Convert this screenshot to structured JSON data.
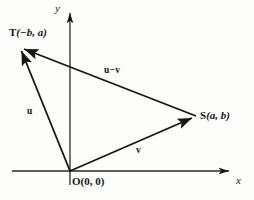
{
  "figure": {
    "type": "vector-diagram",
    "background_color": "#fdfdfc",
    "stroke_color": "#151515",
    "axes": {
      "x_label": "x",
      "y_label": "y",
      "origin_px": [
        70,
        171
      ],
      "x_axis_px": [
        12,
        171,
        233,
        171
      ],
      "y_axis_px": [
        70,
        185,
        70,
        10
      ]
    },
    "points": [
      {
        "id": "T",
        "name": "T",
        "coords_text": "(−b, a)",
        "label_full": "T(−b, a)",
        "px": [
          19,
          47
        ]
      },
      {
        "id": "S",
        "name": "S",
        "coords_text": "(a, b)",
        "label_full": "S(a, b)",
        "px": [
          196,
          117
        ]
      },
      {
        "id": "O",
        "name": "O",
        "coords_text": "(0, 0)",
        "label_full": "O(0, 0)",
        "px": [
          70,
          171
        ]
      }
    ],
    "vectors": [
      {
        "id": "u",
        "label": "u",
        "from": "O",
        "to": "T",
        "arrow_at": "T"
      },
      {
        "id": "v",
        "label": "v",
        "from": "O",
        "to": "S",
        "arrow_at": "S"
      },
      {
        "id": "u-minus-v",
        "label_left": "u",
        "label_op": "−",
        "label_right": "v",
        "label": "u − v",
        "from": "S",
        "to": "T",
        "arrow_at": "T"
      }
    ]
  }
}
